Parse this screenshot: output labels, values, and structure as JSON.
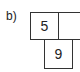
{
  "label": "b)",
  "cells": [
    {
      "value": "5",
      "position": "top-left"
    },
    {
      "value": "",
      "position": "top-right"
    },
    {
      "value": "9",
      "position": "bottom"
    }
  ]
}
